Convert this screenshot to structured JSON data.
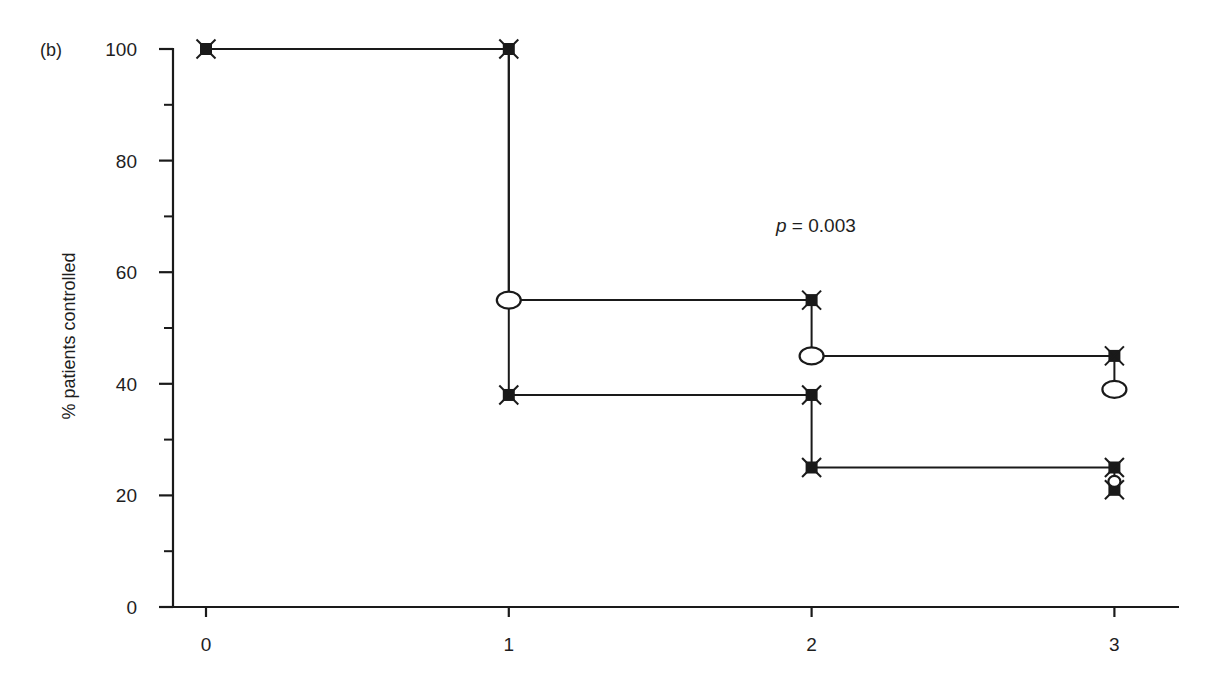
{
  "chart_data": {
    "type": "line",
    "subtype": "kaplan-meier-step",
    "panel_label": "(b)",
    "title": "",
    "xlabel": "",
    "ylabel": "% patients controlled",
    "xlim": [
      0,
      3
    ],
    "ylim": [
      0,
      100
    ],
    "x_ticks": [
      0,
      1,
      2,
      3
    ],
    "y_ticks": [
      0,
      20,
      40,
      60,
      80,
      100
    ],
    "y_minor_ticks": [
      10,
      30,
      50,
      70,
      90
    ],
    "grid": false,
    "legend": null,
    "annotations": [
      {
        "text": "p = 0.003",
        "italic_part": "p",
        "x": 2.0,
        "y": 69
      }
    ],
    "series": [
      {
        "name": "Upper curve",
        "step": "post",
        "points": [
          {
            "x": 0,
            "y": 100,
            "marker": "filled-cross"
          },
          {
            "x": 1,
            "y": 100,
            "marker": "filled-cross"
          },
          {
            "x": 1,
            "y": 55,
            "marker": "open-ellipse"
          },
          {
            "x": 2,
            "y": 55,
            "marker": "filled-cross"
          },
          {
            "x": 2,
            "y": 45,
            "marker": "open-ellipse"
          },
          {
            "x": 3,
            "y": 45,
            "marker": "filled-cross"
          },
          {
            "x": 3,
            "y": 39,
            "marker": "open-ellipse"
          }
        ]
      },
      {
        "name": "Lower curve",
        "step": "post",
        "points": [
          {
            "x": 0,
            "y": 100,
            "marker": "filled-cross"
          },
          {
            "x": 1,
            "y": 100,
            "marker": "filled-cross"
          },
          {
            "x": 1,
            "y": 38,
            "marker": "filled-cross"
          },
          {
            "x": 2,
            "y": 38,
            "marker": "filled-cross"
          },
          {
            "x": 2,
            "y": 25,
            "marker": "filled-cross"
          },
          {
            "x": 3,
            "y": 25,
            "marker": "filled-cross"
          },
          {
            "x": 3,
            "y": 22.5,
            "marker": "open-ellipse"
          },
          {
            "x": 3,
            "y": 21,
            "marker": "filled-cross"
          }
        ]
      }
    ]
  },
  "labels": {
    "panel": "(b)",
    "y_axis_title": "% patients controlled",
    "p_value_prefix": "p",
    "p_value_rest": " = 0.003",
    "x_tick_labels": [
      "0",
      "1",
      "2",
      "3"
    ],
    "y_tick_labels": [
      "0",
      "20",
      "40",
      "60",
      "80",
      "100"
    ]
  },
  "colors": {
    "ink": "#1a1a1a",
    "background": "#ffffff"
  }
}
